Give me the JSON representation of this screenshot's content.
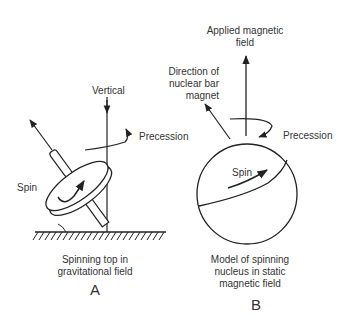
{
  "panel_a": {
    "labels": {
      "vertical": "Vertical",
      "precession": "Precession",
      "spin": "Spin"
    },
    "caption_line1": "Spinning top in",
    "caption_line2": "gravitational field",
    "letter": "A"
  },
  "panel_b": {
    "labels": {
      "applied_field_line1": "Applied magnetic",
      "applied_field_line2": "field",
      "direction_line1": "Direction of",
      "direction_line2": "nuclear bar",
      "direction_line3": "magnet",
      "precession": "Precession",
      "spin": "Spin"
    },
    "caption_line1": "Model of spinning",
    "caption_line2": "nucleus in static",
    "caption_line3": "magnetic field",
    "letter": "B"
  },
  "colors": {
    "ink": "#222222",
    "background": "#ffffff"
  }
}
